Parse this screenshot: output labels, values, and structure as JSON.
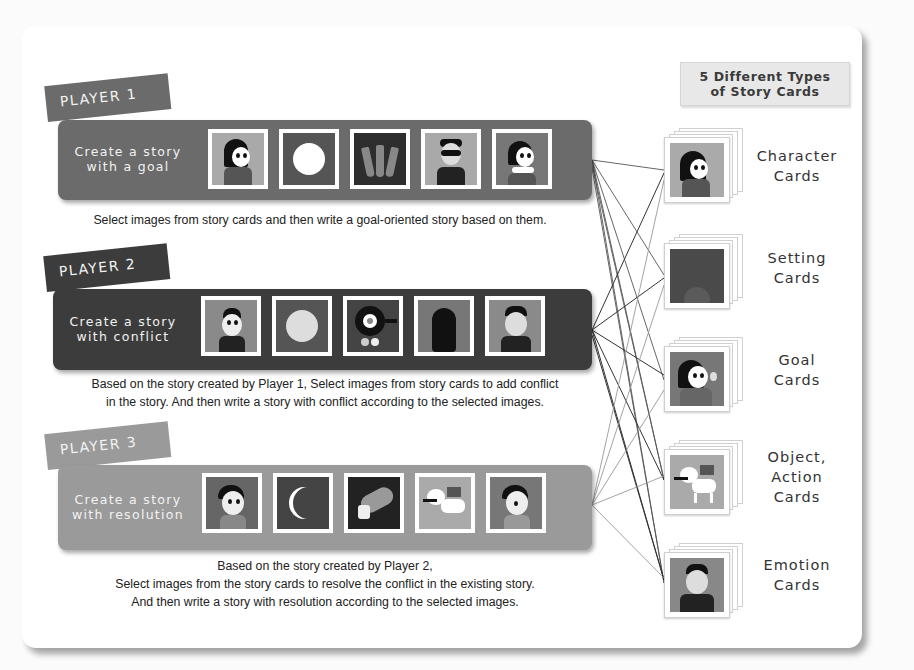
{
  "header": {
    "line1": "5 Different Types",
    "line2": "of Story Cards"
  },
  "players": [
    {
      "tab": "PLAYER 1",
      "task_line1": "Create a story",
      "task_line2": "with a goal",
      "bar_color": "#6b6b6b",
      "images": [
        "girl-character-icon",
        "full-moon-icon",
        "carrots-icon",
        "masked-catwoman-icon",
        "girl-arms-crossed-icon"
      ],
      "caption_lines": [
        "Select images from story cards and then write a goal-oriented story based on them."
      ]
    },
    {
      "tab": "PLAYER 2",
      "task_line1": "Create a story",
      "task_line2": "with conflict",
      "bar_color": "#3c3c3c",
      "images": [
        "boy-character-icon",
        "pale-moon-icon",
        "frying-pan-egg-icon",
        "dark-villain-icon",
        "smug-boy-icon"
      ],
      "caption_lines": [
        "Based on the story created by Player 1, Select images from story cards to add conflict",
        "in the story.  And then write a story with conflict according to the selected images."
      ]
    },
    {
      "tab": "PLAYER 3",
      "task_line1": "Create a story",
      "task_line2": "with resolution",
      "bar_color": "#9a9a9a",
      "images": [
        "happy-kid-icon",
        "crescent-moon-icon",
        "bread-loaf-icon",
        "dog-with-bone-icon",
        "calm-kid-icon"
      ],
      "caption_lines": [
        "Based on the story created by Player 2,",
        "Select images from the story cards to resolve the conflict in the existing story.",
        "And then write a story with resolution according to the selected images."
      ]
    }
  ],
  "card_types": [
    {
      "line1": "Character",
      "line2": "Cards",
      "icon": "girl-character-icon"
    },
    {
      "line1": "Setting",
      "line2": "Cards",
      "icon": "dark-setting-icon"
    },
    {
      "line1": "Goal",
      "line2": "Cards",
      "icon": "waving-girl-icon"
    },
    {
      "line1": "Object,",
      "line2": "Action",
      "line3": "Cards",
      "icon": "dog-with-bone-icon"
    },
    {
      "line1": "Emotion",
      "line2": "Cards",
      "icon": "smug-boy-icon"
    }
  ]
}
